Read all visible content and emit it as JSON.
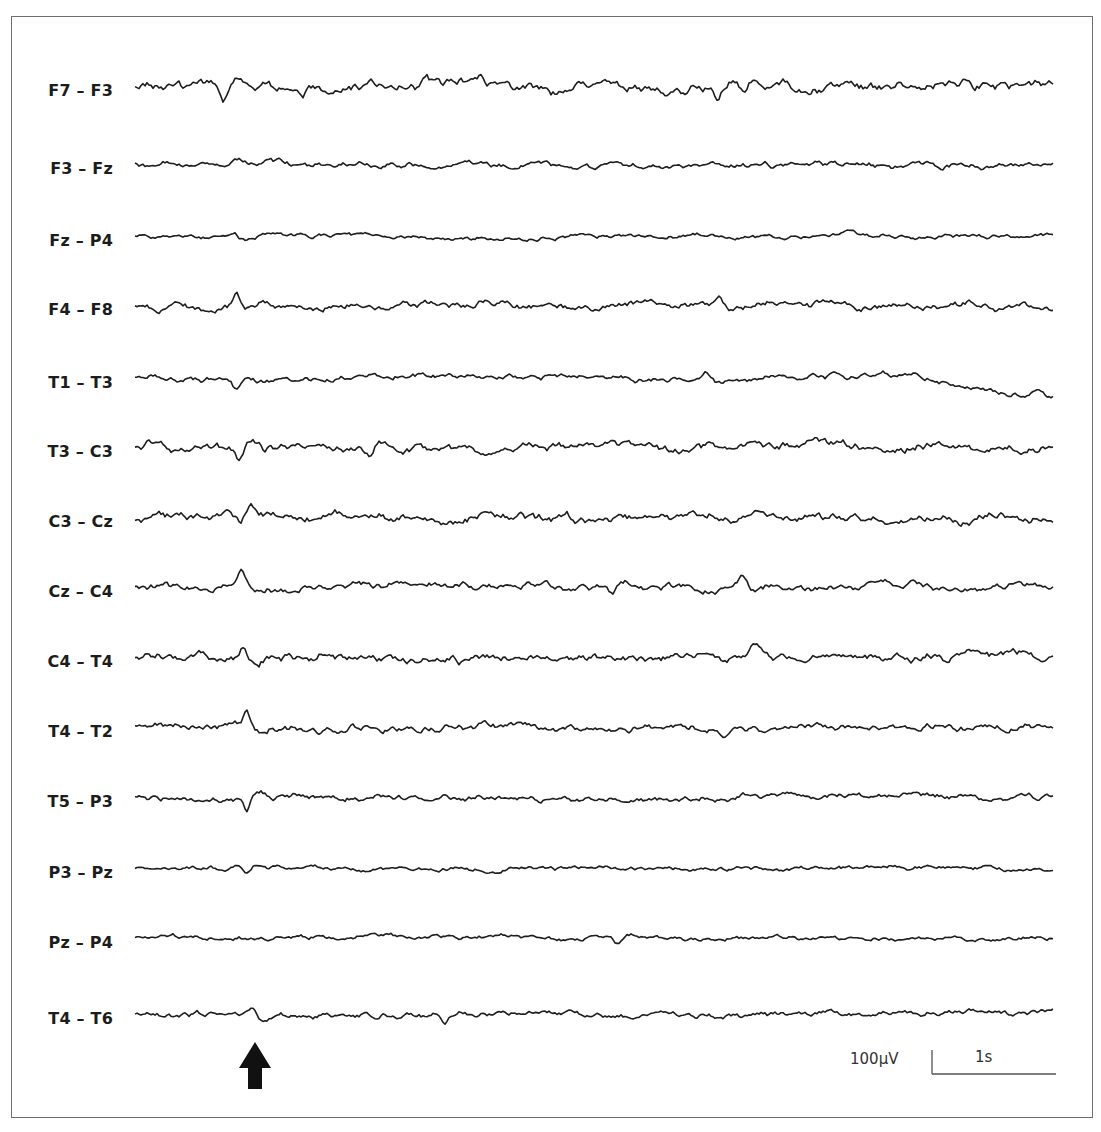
{
  "chart_data": {
    "type": "line",
    "title": "",
    "subtitle": "EEG bipolar montage recording",
    "xlabel": "Time",
    "ylabel": "Amplitude",
    "grid": false,
    "legend": "none",
    "duration_s": 7.4,
    "channels": [
      {
        "label": "F7 – F3",
        "baseline_y": 86,
        "amp": 7,
        "events": [
          [
            0.72,
            12
          ],
          [
            4.7,
            10
          ],
          [
            4.9,
            8
          ]
        ],
        "drift": 0
      },
      {
        "label": "F3 – Fz",
        "baseline_y": 164,
        "amp": 4,
        "events": [
          [
            0.75,
            4
          ]
        ],
        "drift": 0
      },
      {
        "label": "Fz – P4",
        "baseline_y": 236,
        "amp": 3,
        "events": [
          [
            0.8,
            -5
          ]
        ],
        "drift": 0
      },
      {
        "label": "F4 – F8",
        "baseline_y": 305,
        "amp": 5,
        "events": [
          [
            0.82,
            -10
          ],
          [
            4.7,
            -10
          ]
        ],
        "drift": 0
      },
      {
        "label": "T1 – T3",
        "baseline_y": 378,
        "amp": 4,
        "events": [
          [
            0.82,
            10
          ],
          [
            4.6,
            -7
          ]
        ],
        "drift": 20
      },
      {
        "label": "T3 – C3",
        "baseline_y": 447,
        "amp": 6,
        "events": [
          [
            0.84,
            14
          ],
          [
            1.9,
            7
          ]
        ],
        "drift": 0
      },
      {
        "label": "C3 – Cz",
        "baseline_y": 517,
        "amp": 6,
        "events": [
          [
            0.85,
            13
          ]
        ],
        "drift": 0
      },
      {
        "label": "Cz – C4",
        "baseline_y": 587,
        "amp": 5,
        "events": [
          [
            0.86,
            -11
          ],
          [
            3.85,
            9
          ],
          [
            4.9,
            -9
          ]
        ],
        "drift": 0
      },
      {
        "label": "C4 – T4",
        "baseline_y": 657,
        "amp": 6,
        "events": [
          [
            0.87,
            -13
          ],
          [
            5.0,
            -8
          ]
        ],
        "drift": 0
      },
      {
        "label": "T4 – T2",
        "baseline_y": 727,
        "amp": 5,
        "events": [
          [
            0.9,
            -11
          ],
          [
            4.75,
            8
          ]
        ],
        "drift": 0
      },
      {
        "label": "T5 – P3",
        "baseline_y": 797,
        "amp": 4,
        "events": [
          [
            0.9,
            13
          ]
        ],
        "drift": 0
      },
      {
        "label": "P3 – Pz",
        "baseline_y": 868,
        "amp": 3,
        "events": [
          [
            0.9,
            6
          ]
        ],
        "drift": 0
      },
      {
        "label": "Pz – P4",
        "baseline_y": 938,
        "amp": 3,
        "events": [
          [
            3.9,
            6
          ]
        ],
        "drift": 0
      },
      {
        "label": "T4 – T6",
        "baseline_y": 1014,
        "amp": 4,
        "events": [
          [
            0.95,
            -9
          ],
          [
            2.5,
            6
          ]
        ],
        "drift": 0
      }
    ],
    "annotations": [
      {
        "type": "arrow",
        "direction": "up",
        "x_s": 0.95,
        "description": "marks transient sharp discharge across channels"
      }
    ],
    "scale_bar": {
      "amplitude": "100µV",
      "time": "1s",
      "time_px": 124,
      "amp_px": 24
    }
  },
  "scale": {
    "amplitude_label": "100µV",
    "time_label": "1s"
  },
  "colors": {
    "trace": "#1e1e1e",
    "frame": "#6e6e6e",
    "label": "#1c1c1c"
  }
}
